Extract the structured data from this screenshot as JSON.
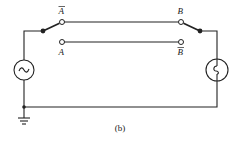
{
  "diagram": {
    "type": "circuit",
    "caption": "(b)",
    "components": {
      "source": {
        "label_symbol": "~",
        "kind": "ac-source"
      },
      "lamp": {
        "kind": "lamp"
      },
      "ground": {
        "kind": "ground"
      },
      "switch_left": {
        "kind": "spdt-switch",
        "position": "A-bar"
      },
      "switch_right": {
        "kind": "spdt-switch",
        "position": "B"
      }
    },
    "labels": {
      "a_bar": "A",
      "a": "A",
      "b": "B",
      "b_bar": "B"
    },
    "connections": [
      "A-bar contact to B contact (upper wire)",
      "A contact to B-bar contact (lower wire)",
      "source to left switch pivot",
      "right switch pivot to lamp",
      "source and lamp return via bottom wire to ground"
    ],
    "colors": {
      "line": "#222222",
      "background": "#ffffff"
    }
  }
}
